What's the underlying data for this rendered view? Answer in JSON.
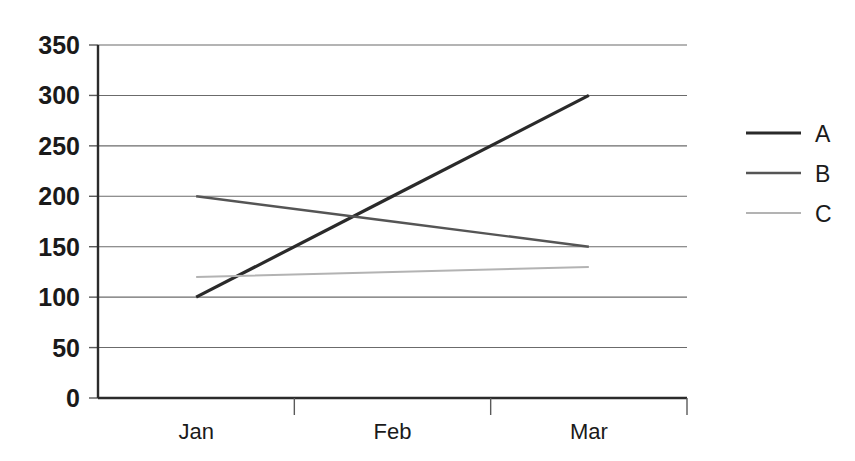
{
  "chart_data": {
    "type": "line",
    "title": "",
    "xlabel": "",
    "ylabel": "",
    "categories": [
      "Jan",
      "Feb",
      "Mar"
    ],
    "ylim": [
      0,
      350
    ],
    "yticks": [
      0,
      50,
      100,
      150,
      200,
      250,
      300,
      350
    ],
    "grid": true,
    "legend_position": "right",
    "series": [
      {
        "name": "A",
        "values": [
          100,
          200,
          300
        ],
        "color": "#2a2a2a",
        "width": 3.2
      },
      {
        "name": "B",
        "values": [
          200,
          175,
          150
        ],
        "color": "#555555",
        "width": 2.4
      },
      {
        "name": "C",
        "values": [
          120,
          125,
          130
        ],
        "color": "#b3b3b3",
        "width": 2.0
      }
    ]
  },
  "axis": {
    "ytick_labels": [
      "0",
      "50",
      "100",
      "150",
      "200",
      "250",
      "300",
      "350"
    ],
    "xtick_labels": [
      "Jan",
      "Feb",
      "Mar"
    ]
  },
  "legend": {
    "entries": [
      {
        "label": "A",
        "color": "#2a2a2a"
      },
      {
        "label": "B",
        "color": "#555555"
      },
      {
        "label": "C",
        "color": "#b3b3b3"
      }
    ]
  }
}
